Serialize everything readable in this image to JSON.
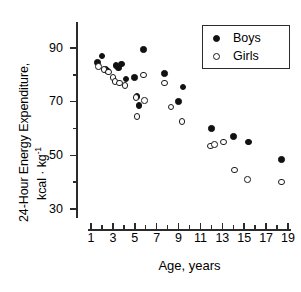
{
  "chart_data": {
    "type": "scatter",
    "title": "",
    "xlabel": "Age, years",
    "ylabel_line1": "24-Hour Energy Expenditure,",
    "ylabel_line2_prefix": "kcal · kg",
    "ylabel_line2_sup": "-1",
    "xlim": [
      0,
      20
    ],
    "ylim": [
      28,
      94
    ],
    "xticks_major": [
      1,
      3,
      5,
      7,
      9,
      11,
      13,
      15,
      17,
      19
    ],
    "xticks_minor": [
      2,
      4,
      6,
      8,
      10,
      12,
      14,
      16,
      18
    ],
    "yticks_major": [
      90,
      70,
      50,
      30
    ],
    "yticks_minor": [
      80,
      60,
      40
    ],
    "grid": false,
    "legend_position": "top-right",
    "series": [
      {
        "name": "Boys",
        "marker": "filled-circle",
        "color": "#111111",
        "points": [
          {
            "x": 1.6,
            "y": 84.5
          },
          {
            "x": 2.0,
            "y": 87.0
          },
          {
            "x": 2.3,
            "y": 82.0
          },
          {
            "x": 2.5,
            "y": 81.5
          },
          {
            "x": 3.3,
            "y": 83.5
          },
          {
            "x": 3.5,
            "y": 82.5
          },
          {
            "x": 3.8,
            "y": 84.0
          },
          {
            "x": 4.2,
            "y": 78.5
          },
          {
            "x": 5.0,
            "y": 79.0
          },
          {
            "x": 5.2,
            "y": 72.0
          },
          {
            "x": 5.4,
            "y": 68.5
          },
          {
            "x": 5.8,
            "y": 89.5
          },
          {
            "x": 7.7,
            "y": 80.5
          },
          {
            "x": 9.0,
            "y": 70.0
          },
          {
            "x": 9.4,
            "y": 75.5
          },
          {
            "x": 12.0,
            "y": 60.0
          },
          {
            "x": 14.0,
            "y": 57.0
          },
          {
            "x": 15.4,
            "y": 55.0
          },
          {
            "x": 18.4,
            "y": 48.5
          }
        ]
      },
      {
        "name": "Girls",
        "marker": "open-circle",
        "color": "#1a1a1a",
        "points": [
          {
            "x": 1.7,
            "y": 83.0
          },
          {
            "x": 2.2,
            "y": 82.0
          },
          {
            "x": 2.6,
            "y": 81.0
          },
          {
            "x": 3.0,
            "y": 79.0
          },
          {
            "x": 3.2,
            "y": 77.5
          },
          {
            "x": 3.6,
            "y": 77.0
          },
          {
            "x": 4.1,
            "y": 76.0
          },
          {
            "x": 5.1,
            "y": 71.5
          },
          {
            "x": 5.2,
            "y": 64.5
          },
          {
            "x": 5.8,
            "y": 80.0
          },
          {
            "x": 5.9,
            "y": 70.5
          },
          {
            "x": 7.7,
            "y": 77.0
          },
          {
            "x": 8.3,
            "y": 68.0
          },
          {
            "x": 9.3,
            "y": 62.5
          },
          {
            "x": 11.9,
            "y": 53.5
          },
          {
            "x": 12.3,
            "y": 54.0
          },
          {
            "x": 13.1,
            "y": 55.0
          },
          {
            "x": 14.1,
            "y": 44.5
          },
          {
            "x": 15.3,
            "y": 41.0
          },
          {
            "x": 18.4,
            "y": 40.0
          }
        ]
      }
    ]
  },
  "legend": {
    "entries": [
      {
        "label": "Boys",
        "marker": "filled-circle"
      },
      {
        "label": "Girls",
        "marker": "open-circle"
      }
    ]
  }
}
